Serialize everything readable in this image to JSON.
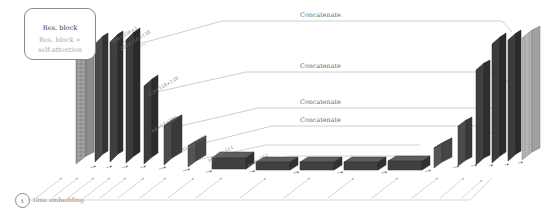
{
  "figure": {
    "type": "architecture-diagram",
    "background": "#ffffff"
  },
  "legend": {
    "arrow_dark_label": "Res. block",
    "arrow_gray_label_line1": "Res. block +",
    "arrow_gray_label_line2": "self-attention",
    "dark_color": "#3a3a3a",
    "gray_color": "#a8a8a8"
  },
  "dimension_labels": [
    {
      "text": "256×256×3",
      "x": 112,
      "y": 40
    },
    {
      "text": "256×256×128",
      "x": 120,
      "y": 46
    },
    {
      "text": "128×128×128",
      "x": 148,
      "y": 92
    },
    {
      "text": "64×64×256",
      "x": 152,
      "y": 128
    },
    {
      "text": "32×32×256",
      "x": 182,
      "y": 147
    },
    {
      "text": "16×16×512",
      "x": 206,
      "y": 158
    },
    {
      "text": "8×8×512",
      "x": 246,
      "y": 163
    }
  ],
  "concatenate_labels": [
    {
      "text": "Concatenate",
      "x": 300,
      "y": 17
    },
    {
      "text": "Concatenate",
      "x": 300,
      "y": 68
    },
    {
      "text": "Concatenate",
      "x": 300,
      "y": 104
    },
    {
      "text": "Concatenate",
      "x": 300,
      "y": 122
    }
  ],
  "time_embedding": {
    "node_label": "t",
    "caption": "time embedding"
  },
  "colors": {
    "slab_dark": "#3b3b3b",
    "slab_mid": "#555555",
    "slab_edge": "#2a2a2a",
    "slab_light": "#9a9a9a",
    "noise_light": "#b0b0b0",
    "line": "#9b9b9b",
    "text": "#6e6e6e"
  },
  "encoder_blocks": [
    {
      "name": "input-image-slab",
      "w": 10,
      "h": 118,
      "fill": "#9a9a9a"
    },
    {
      "name": "enc-slab-1",
      "w": 7,
      "h": 112,
      "fill": "#3b3b3b"
    },
    {
      "name": "enc-slab-2",
      "w": 7,
      "h": 110,
      "fill": "#3b3b3b"
    },
    {
      "name": "enc-slab-3",
      "w": 7,
      "h": 84,
      "fill": "#3b3b3b"
    },
    {
      "name": "enc-slab-4",
      "w": 10,
      "h": 38,
      "fill": "#4a4a4a"
    },
    {
      "name": "enc-slab-5",
      "w": 10,
      "h": 22,
      "fill": "#555555"
    }
  ],
  "bottleneck_blocks": [
    {
      "name": "bottleneck-1",
      "w": 34,
      "h": 12
    },
    {
      "name": "bottleneck-2",
      "w": 34,
      "h": 8
    },
    {
      "name": "bottleneck-3",
      "w": 34,
      "h": 8
    },
    {
      "name": "bottleneck-4",
      "w": 34,
      "h": 8
    },
    {
      "name": "bottleneck-5",
      "w": 34,
      "h": 9
    }
  ],
  "decoder_blocks": [
    {
      "name": "dec-slab-1",
      "w": 10,
      "h": 22,
      "fill": "#555555"
    },
    {
      "name": "dec-slab-2",
      "w": 7,
      "h": 42,
      "fill": "#3b3b3b"
    },
    {
      "name": "dec-slab-3",
      "w": 7,
      "h": 90,
      "fill": "#3b3b3b"
    },
    {
      "name": "dec-slab-4",
      "w": 7,
      "h": 112,
      "fill": "#3b3b3b"
    },
    {
      "name": "dec-slab-5",
      "w": 7,
      "h": 118,
      "fill": "#3b3b3b"
    },
    {
      "name": "output-image-slab",
      "w": 10,
      "h": 126,
      "fill": "#b0b0b0"
    }
  ]
}
